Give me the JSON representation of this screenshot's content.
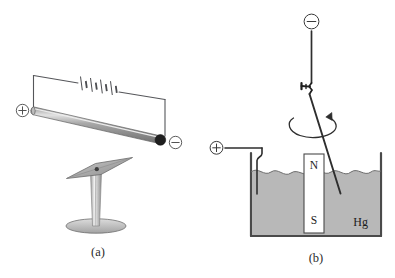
{
  "figure": {
    "background_color": "#ffffff",
    "ink_color": "#3a3a3a",
    "panels": [
      {
        "id": "a",
        "caption": "(a)",
        "description": "Current-carrying rod above a pivoted compass needle",
        "elements": {
          "positive_terminal": "+",
          "negative_terminal": "−",
          "battery_name": "battery-symbol",
          "battery_cells": 4,
          "rod_name": "conducting-rod",
          "rod_color": "#8f8f8f",
          "rod_highlight_color": "#d9d9d9",
          "rod_cap_color": "#1f1f1f",
          "needle_name": "compass-needle",
          "needle_color": "#b3b3b3",
          "stand_name": "needle-stand",
          "base_color": "#c9c9c9"
        }
      },
      {
        "id": "b",
        "caption": "(b)",
        "description": "Wire rotating about a magnet in a mercury bath",
        "elements": {
          "positive_terminal": "+",
          "negative_terminal": "−",
          "liquid_label": "Hg",
          "liquid_color": "#b8b8b8",
          "magnet_north_label": "N",
          "magnet_south_label": "S",
          "magnet_body_color": "#ffffff",
          "rotation_indicator": "rotation-arrow",
          "pivot_name": "wire-pivot-clamp",
          "container_name": "mercury-container",
          "container_wall_color": "#4a4a4a"
        }
      }
    ]
  }
}
